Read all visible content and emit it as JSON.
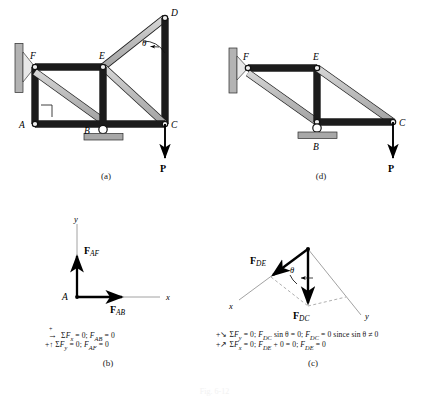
{
  "figure": {
    "type": "engineering-statics-truss-diagram",
    "bottom_caption": "Fig. 6-12"
  },
  "colors": {
    "member_fill": "#b9b9b9",
    "member_fill_light": "#d2d2d2",
    "member_stroke": "#1b1b1b",
    "support_fill": "#a8a8a8",
    "force_arrow": "#000000",
    "axis_line": "#8a8a8a",
    "dashed_guide": "#9a9a9a"
  },
  "panels": [
    {
      "id": "a",
      "caption": "(a)",
      "description": "Full truss with members AF, AE, AB-BC, FE, ED, EC, DC and applied load P at C",
      "joints": [
        "D",
        "F",
        "E",
        "A",
        "B",
        "C"
      ],
      "angle_label": "θ",
      "load_label": "P",
      "right_angle_marker": true,
      "supports": [
        "wall-pin-at-F",
        "wall-pin-at-A",
        "roller-at-B"
      ]
    },
    {
      "id": "d",
      "caption": "(d)",
      "description": "Reduced truss after zero-force members removed: F, E, B, C with load P at C",
      "joints": [
        "F",
        "E",
        "B",
        "C"
      ],
      "load_label": "P",
      "supports": [
        "wall-pin-at-F",
        "roller-at-B"
      ]
    }
  ],
  "fbd_b": {
    "caption": "(b)",
    "origin_label": "A",
    "axes": {
      "x": "x",
      "y": "y"
    },
    "forces": [
      {
        "name": "F_AF",
        "label_main": "F",
        "label_sub": "AF",
        "direction": "up"
      },
      {
        "name": "F_AB",
        "label_main": "F",
        "label_sub": "AB",
        "direction": "right"
      }
    ],
    "equations": [
      {
        "arrow": "→",
        "sign": "+",
        "text": "ΣFₓ = 0;  Fₐᵦ = 0",
        "plain": "ΣFx = 0; FAB = 0"
      },
      {
        "arrow": "↑",
        "sign": "+",
        "text": "ΣFᵧ = 0;  Fₐᶠ = 0",
        "plain": "+↑ΣFy = 0; FAF = 0"
      }
    ],
    "eq_lines": [
      "ΣFₓ = 0;  Fₐₘ = 0",
      "ΣFᵧ = 0;  Fₐₘ = 0"
    ],
    "eq_text_1": "ΣF",
    "eq_sub_1": "x",
    "eq_rest_1": " = 0;  F",
    "eq_sub_1b": "AB",
    "eq_end_1": " = 0",
    "eq_text_2": "ΣF",
    "eq_sub_2": "y",
    "eq_rest_2": " = 0;  F",
    "eq_sub_2b": "AF",
    "eq_end_2": " = 0"
  },
  "fbd_c": {
    "caption": "(c)",
    "axes": {
      "x": "x",
      "y": "y"
    },
    "angle_label": "θ",
    "forces": [
      {
        "name": "F_DE",
        "label_main": "F",
        "label_sub": "DE",
        "direction": "down-left"
      },
      {
        "name": "F_DC",
        "label_main": "F",
        "label_sub": "DC",
        "direction": "down"
      }
    ],
    "equations": [
      {
        "prefix": "+",
        "text_a": "ΣF",
        "sub_a": "y",
        "rest_a": " = 0;  F",
        "sub_b": "DC",
        "rest_b": " sin θ = 0;  F",
        "sub_c": "DC",
        "rest_c": " = 0 since sin θ ≠ 0"
      },
      {
        "prefix": "+",
        "text_a": "ΣF",
        "sub_a": "x",
        "rest_a": " = 0;  F",
        "sub_b": "DE",
        "rest_b": " + 0 = 0;  F",
        "sub_c": "DE",
        "rest_c": " = 0"
      }
    ]
  },
  "labels": {
    "A": "A",
    "B": "B",
    "C": "C",
    "D": "D",
    "E": "E",
    "F": "F",
    "P": "P",
    "theta": "θ",
    "x": "x",
    "y": "y",
    "cap_a": "(a)",
    "cap_b": "(b)",
    "cap_c": "(c)",
    "cap_d": "(d)"
  }
}
